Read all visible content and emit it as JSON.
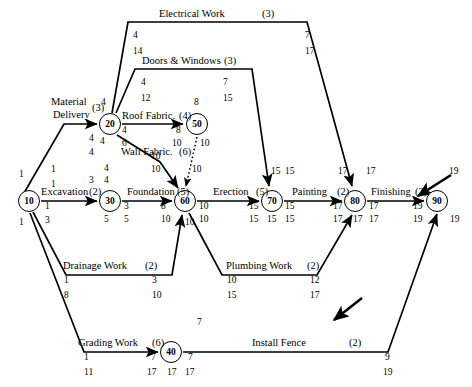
{
  "diagram": {
    "type": "activity-on-arrow network (PERT/CPM)",
    "nodes": [
      {
        "id": "10",
        "label": "10",
        "x": 29,
        "y": 201,
        "above": "",
        "early_left": "1",
        "late_left": "1",
        "early_right": "1",
        "late_right": "3"
      },
      {
        "id": "20",
        "label": "20",
        "x": 110,
        "y": 124,
        "above": "4",
        "early_left": "4",
        "late_left": "4",
        "early_right": "4",
        "late_right": "6"
      },
      {
        "id": "30",
        "label": "30",
        "x": 110,
        "y": 201,
        "above": "3",
        "early_left": "3",
        "late_left": "5",
        "early_right": "3",
        "late_right": "5"
      },
      {
        "id": "40",
        "label": "40",
        "x": 171,
        "y": 345,
        "above": "7",
        "early_left": "7",
        "late_left": "17",
        "early_right": "7",
        "late_right": "17"
      },
      {
        "id": "50",
        "label": "50",
        "x": 197,
        "y": 124,
        "above": "8",
        "early_left": "8",
        "late_left": "10",
        "early_right": "10",
        "late_right": ""
      },
      {
        "id": "60",
        "label": "60",
        "x": 185,
        "y": 201,
        "above": "",
        "early_left": "8",
        "late_left": "10",
        "early_right": "10",
        "late_right": "10"
      },
      {
        "id": "70",
        "label": "70",
        "x": 272,
        "y": 201,
        "above": "15",
        "early_left": "15",
        "late_left": "15",
        "early_right": "15",
        "late_right": "15"
      },
      {
        "id": "80",
        "label": "80",
        "x": 355,
        "y": 201,
        "above": "17",
        "early_left": "17",
        "late_left": "17",
        "early_right": "17",
        "late_right": "17"
      },
      {
        "id": "90",
        "label": "90",
        "x": 437,
        "y": 201,
        "above": "19",
        "early_left": "19",
        "late_left": "19",
        "early_right": "19",
        "late_right": ""
      }
    ],
    "activities": [
      {
        "name": "Material Delivery",
        "duration": "(3)",
        "from": "10",
        "to": "20",
        "tail_early": "1",
        "tail_late": "1",
        "head_early": "4",
        "head_late": "4"
      },
      {
        "name": "Excavation",
        "duration": "(2)",
        "from": "10",
        "to": "30",
        "tail_early": "1",
        "tail_late": "3",
        "head_early": "3",
        "head_late": "5"
      },
      {
        "name": "Drainage Work",
        "duration": "(2)",
        "from": "10",
        "to": "60",
        "tail_early": "1",
        "tail_late": "8",
        "head_early": "3",
        "head_late": "10"
      },
      {
        "name": "Grading Work",
        "duration": "(6)",
        "from": "10",
        "to": "40",
        "tail_early": "1",
        "tail_late": "11",
        "head_early": "7",
        "head_late": "17"
      },
      {
        "name": "Electrical Work",
        "duration": "(3)",
        "from": "20",
        "to": "80",
        "tail_early": "4",
        "tail_late": "14",
        "head_early": "7",
        "head_late": "17"
      },
      {
        "name": "Doors & Windows",
        "duration": "(3)",
        "from": "20",
        "to": "70",
        "tail_early": "4",
        "tail_late": "12",
        "head_early": "7",
        "head_late": "15"
      },
      {
        "name": "Roof Fabric.",
        "duration": "(4)",
        "from": "20",
        "to": "50",
        "tail_early": "4",
        "tail_late": "6",
        "head_early": "8",
        "head_late": "10"
      },
      {
        "name": "Wall Fabric.",
        "duration": "(6)",
        "from": "20",
        "to": "60",
        "tail_early": "4",
        "tail_late": "4",
        "head_early": "10",
        "head_late": "10"
      },
      {
        "name": "Foundation",
        "duration": "(5)",
        "from": "30",
        "to": "60",
        "tail_early": "3",
        "tail_late": "5",
        "head_early": "8",
        "head_late": "10"
      },
      {
        "name": "Erection",
        "duration": "(5)",
        "from": "60",
        "to": "70",
        "tail_early": "10",
        "tail_late": "10",
        "head_early": "15",
        "head_late": "15"
      },
      {
        "name": "Painting",
        "duration": "(2)",
        "from": "70",
        "to": "80",
        "tail_early": "15",
        "tail_late": "15",
        "head_early": "17",
        "head_late": "17"
      },
      {
        "name": "Finishing",
        "duration": "(2)",
        "from": "80",
        "to": "90",
        "tail_early": "17",
        "tail_late": "17",
        "head_early": "19",
        "head_late": "19"
      },
      {
        "name": "Plumbing Work",
        "duration": "(2)",
        "from": "60",
        "to": "80",
        "tail_early": "10",
        "tail_late": "15",
        "head_early": "12",
        "head_late": "17"
      },
      {
        "name": "Install Fence",
        "duration": "(2)",
        "from": "40",
        "to": "90",
        "tail_early": "7",
        "tail_late": "17",
        "head_early": "9",
        "head_late": "19"
      },
      {
        "name": "",
        "duration": "",
        "from": "50",
        "to": "60",
        "tail_early": "10",
        "tail_late": "",
        "head_early": "10",
        "head_late": "",
        "dummy": true
      }
    ]
  },
  "labels": {
    "material_delivery_line1": "Material",
    "material_delivery_line2": "Delivery",
    "material_delivery_dur": "(3)",
    "excavation": "Excavation",
    "excavation_dur": "(2)",
    "drainage": "Drainage Work",
    "drainage_dur": "(2)",
    "grading": "Grading Work",
    "grading_dur": "(6)",
    "electrical": "Electrical Work",
    "electrical_dur": "(3)",
    "doors_windows": "Doors & Windows",
    "doors_windows_dur": "(3)",
    "roof_fabric": "Roof Fabric.",
    "roof_fabric_dur": "(4)",
    "wall_fabric": "Wall Fabric.",
    "wall_fabric_dur": "(6)",
    "foundation": "Foundation",
    "foundation_dur": "(5)",
    "erection": "Erection",
    "erection_dur": "(5)",
    "painting": "Painting",
    "painting_dur": "(2)",
    "finishing": "Finishing",
    "finishing_dur": "(2)",
    "plumbing": "Plumbing Work",
    "plumbing_dur": "(2)",
    "install_fence": "Install Fence",
    "install_fence_dur": "(2)"
  },
  "numbers": {
    "n10_top": "1",
    "n10_bot": "1",
    "n10_exc_e": "1",
    "n10_exc_l": "3",
    "n20_top": "4",
    "n20_left_e": "4",
    "n20_left_l": "4",
    "n20_bl": "4",
    "n20_roof_e": "4",
    "n20_roof_l": "6",
    "n30_top_e": "4",
    "n30_top_l": "4",
    "n30_left": "3",
    "n30_right_e": "3",
    "n30_right_l": "5",
    "n30_bl": "5",
    "n50_top": "8",
    "n50_left_e": "8",
    "n50_left_l": "10",
    "n50_right": "10",
    "n60_wall_e": "10",
    "n60_wall_l": "10",
    "n60_dummy": "10",
    "n60_found_e": "8",
    "n60_found_l": "10",
    "n60_bot": "10",
    "n60_erect_e": "10",
    "n60_erect_l": "10",
    "n70_top": "15",
    "n70_left_e": "15",
    "n70_left_l": "15",
    "n70_bot": "15",
    "n70_right_e": "15",
    "n70_right_l": "15",
    "n70_dw": "15",
    "n80_top": "17",
    "n80_left_e": "17",
    "n80_left_l": "17",
    "n80_bot": "17",
    "n80_right_e": "17",
    "n80_right_l": "17",
    "n80_elec": "17",
    "n90_top": "19",
    "n90_left_e": "19",
    "n90_left_l": "19",
    "n90_right": "19",
    "elec_tail_e": "4",
    "elec_tail_l": "14",
    "elec_head_e": "7",
    "elec_head_l": "17",
    "dw_tail_e": "4",
    "dw_tail_l": "12",
    "dw_head_e": "7",
    "dw_head_l": "15",
    "drain_tail_e": "1",
    "drain_tail_l": "8",
    "drain_head_e": "3",
    "drain_head_l": "10",
    "plumb_tail_e": "10",
    "plumb_tail_l": "15",
    "plumb_head_e": "12",
    "plumb_head_l": "17",
    "grad_tail_e": "1",
    "grad_tail_l": "11",
    "grad_head_e": "7",
    "grad_head_l": "17",
    "n40_top": "7",
    "n40_left_e": "7",
    "n40_left_l": "17",
    "n40_bot": "17",
    "n40_right_e": "7",
    "n40_right_l": "17",
    "fence_head_e": "9",
    "fence_head_l": "19",
    "md_tail_e": "1",
    "md_tail_l": "1",
    "md_head_e": "4",
    "md_head_l": "4"
  },
  "colors": {
    "line": "#000000",
    "background": "#ffffff"
  }
}
